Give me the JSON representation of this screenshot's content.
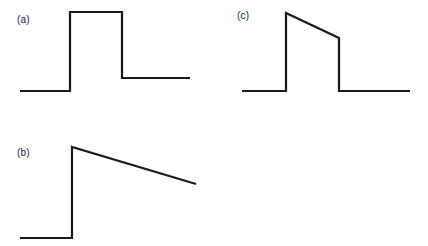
{
  "figure": {
    "width": 428,
    "height": 246,
    "background_color": "#ffffff",
    "stroke_color": "#1a1a1a",
    "stroke_width": 2.2
  },
  "panels": [
    {
      "id": "a",
      "label": "(a)",
      "label_position": {
        "x": 17,
        "y": 14
      },
      "description": "rectangular pulse with elevated tail"
    },
    {
      "id": "b",
      "label": "(b)",
      "label_position": {
        "x": 17,
        "y": 147
      },
      "description": "sawtooth: step rise then linear decay"
    },
    {
      "id": "c",
      "label": "(c)",
      "label_position": {
        "x": 237,
        "y": 10
      },
      "description": "trapezoidal pulse with sloped top"
    }
  ],
  "chart_data": [
    {
      "type": "line",
      "id": "a",
      "title": "(a)",
      "xlabel": "",
      "ylabel": "",
      "grid": false,
      "legend": "none",
      "xlim": [
        0,
        214
      ],
      "ylim": [
        0,
        123
      ],
      "series": [
        {
          "name": "waveform-a",
          "points": [
            [
              20,
              91
            ],
            [
              70,
              91
            ],
            [
              70,
              12
            ],
            [
              122,
              12
            ],
            [
              122,
              78
            ],
            [
              190,
              78
            ]
          ]
        }
      ]
    },
    {
      "type": "line",
      "id": "b",
      "title": "(b)",
      "xlabel": "",
      "ylabel": "",
      "grid": false,
      "legend": "none",
      "xlim": [
        0,
        214
      ],
      "ylim": [
        123,
        246
      ],
      "series": [
        {
          "name": "waveform-b",
          "points": [
            [
              20,
              238
            ],
            [
              72,
              238
            ],
            [
              72,
              147
            ],
            [
              196,
              184
            ]
          ]
        }
      ]
    },
    {
      "type": "line",
      "id": "c",
      "title": "(c)",
      "xlabel": "",
      "ylabel": "",
      "grid": false,
      "legend": "none",
      "xlim": [
        214,
        428
      ],
      "ylim": [
        0,
        123
      ],
      "series": [
        {
          "name": "waveform-c",
          "points": [
            [
              242,
              91
            ],
            [
              286,
              91
            ],
            [
              286,
              13
            ],
            [
              339,
              38
            ],
            [
              339,
              91
            ],
            [
              410,
              91
            ]
          ]
        }
      ]
    }
  ]
}
